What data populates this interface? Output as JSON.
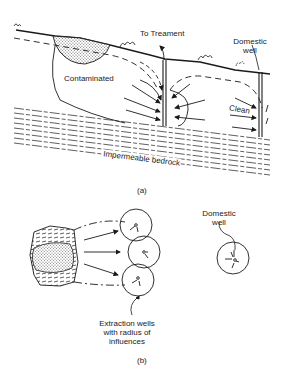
{
  "figure_a": {
    "caption": "(a)",
    "labels": {
      "to_treatment": "To Treament",
      "domestic_well": "Domestic\nwell",
      "domestic_line1": "Domestic",
      "domestic_line2": "well",
      "contaminated": "Contaminated",
      "clean": "Clean",
      "bedrock": "Impermeable bedrock"
    }
  },
  "figure_b": {
    "caption": "(b)",
    "labels": {
      "domestic_line1": "Domestic",
      "domestic_line2": "well",
      "extraction_line1": "Extraction wells",
      "extraction_line2": "with radius of",
      "extraction_line3": "influences"
    }
  },
  "colors": {
    "ink": "#1a1a1a",
    "background": "#ffffff",
    "stipple": "#9a9a9a"
  }
}
